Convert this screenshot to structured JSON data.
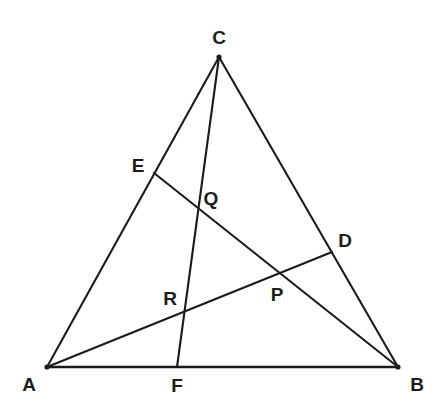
{
  "figure": {
    "type": "geometry-diagram",
    "background_color": "#ffffff",
    "line_color": "#1b1b1b",
    "label_color": "#1d1d1d",
    "canvas": {
      "width": 444,
      "height": 410
    }
  },
  "points": {
    "A": {
      "label": "A",
      "x": 47,
      "y": 367,
      "label_x": 29,
      "label_y": 384,
      "kind": "vertex"
    },
    "B": {
      "label": "B",
      "x": 398,
      "y": 367,
      "label_x": 417,
      "label_y": 384,
      "kind": "vertex"
    },
    "C": {
      "label": "C",
      "x": 219,
      "y": 57,
      "label_x": 219,
      "label_y": 37,
      "kind": "vertex"
    },
    "D": {
      "label": "D",
      "x": 332,
      "y": 252,
      "label_x": 345,
      "label_y": 240,
      "kind": "side-point"
    },
    "E": {
      "label": "E",
      "x": 154,
      "y": 173,
      "label_x": 138,
      "label_y": 165,
      "kind": "side-point"
    },
    "F": {
      "label": "F",
      "x": 177,
      "y": 367,
      "label_x": 177,
      "label_y": 385,
      "kind": "side-point"
    },
    "P": {
      "label": "P",
      "x": 280,
      "y": 271,
      "label_x": 277,
      "label_y": 294,
      "kind": "intersection"
    },
    "Q": {
      "label": "Q",
      "x": 199,
      "y": 206,
      "label_x": 211,
      "label_y": 198,
      "kind": "intersection"
    },
    "R": {
      "label": "R",
      "x": 183,
      "y": 310,
      "label_x": 170,
      "label_y": 298,
      "kind": "intersection"
    }
  },
  "segments": [
    {
      "name": "side-AC",
      "from": "A",
      "to": "C",
      "style": "solid"
    },
    {
      "name": "side-CB",
      "from": "C",
      "to": "B",
      "style": "solid"
    },
    {
      "name": "side-AB",
      "from": "A",
      "to": "B",
      "style": "solid"
    },
    {
      "name": "cevian-AD",
      "from": "A",
      "to": "D",
      "style": "solid"
    },
    {
      "name": "cevian-BE",
      "from": "B",
      "to": "E",
      "style": "solid"
    },
    {
      "name": "cevian-CF",
      "from": "C",
      "to": "F",
      "style": "solid"
    }
  ],
  "labels_order": [
    "C",
    "E",
    "Q",
    "D",
    "R",
    "P",
    "A",
    "F",
    "B"
  ]
}
